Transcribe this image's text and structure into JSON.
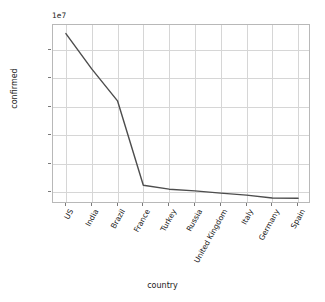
{
  "chart_data": {
    "type": "line",
    "title": "",
    "xlabel": "country",
    "ylabel": "confirmed",
    "offset_text": "1e7",
    "categories": [
      "US",
      "India",
      "Brazil",
      "France",
      "Turkey",
      "Russia",
      "United Kingdom",
      "Italy",
      "Germany",
      "Spain"
    ],
    "values": [
      32800000,
      26600000,
      21000000,
      6200000,
      5500000,
      5200000,
      4800000,
      4450000,
      3950000,
      3900000
    ],
    "series": [
      {
        "name": "confirmed",
        "values": [
          32800000,
          26600000,
          21000000,
          6200000,
          5500000,
          5200000,
          4800000,
          4450000,
          3950000,
          3900000
        ]
      }
    ],
    "ytick_labels": [
      "0.5",
      "1.0",
      "1.5",
      "2.0",
      "2.5",
      "3.0"
    ],
    "ytick_values": [
      5000000,
      10000000,
      15000000,
      20000000,
      25000000,
      30000000
    ],
    "ylim": [
      2900000,
      34300000
    ],
    "xlim": [
      -0.5,
      9.5
    ],
    "grid": true,
    "legend": false,
    "line_color": "#4d4d4d",
    "grid_color": "#d6d6d6",
    "axes_color": "#b8b8b8",
    "background_color": "#ffffff"
  }
}
